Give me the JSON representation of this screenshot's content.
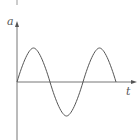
{
  "diagram": {
    "type": "sine-wave-graph",
    "y_axis_label": "a",
    "x_axis_label": "t",
    "colors": {
      "axis": "#777777",
      "curve": "#555555",
      "label": "#555555"
    },
    "curve": {
      "function": "sine",
      "periods": 1.5,
      "starts_at_origin": true
    }
  }
}
